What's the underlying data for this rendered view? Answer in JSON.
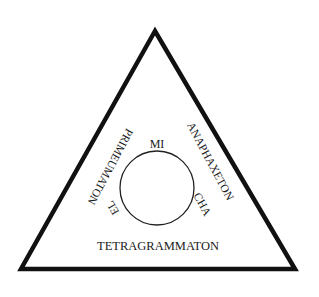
{
  "diagram": {
    "shape": "triangle-with-inscribed-circle",
    "colors": {
      "stroke": "#111111",
      "background": "#ffffff",
      "text": "#1a1a1a"
    },
    "triangle_sides": {
      "left": "PRIMEUMATON",
      "right": "ANAPHAXETON",
      "bottom": "TETRAGRAMMATON"
    },
    "circle_labels": {
      "top": "MI",
      "left": "EL",
      "right": "CHA"
    }
  }
}
